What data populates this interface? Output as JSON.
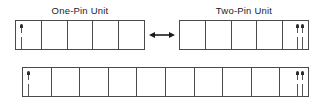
{
  "diagram": {
    "background_color": "#ffffff",
    "line_color": "#4a4a4a",
    "pin_color": "#2b2b2b",
    "units": [
      {
        "id": "one-pin-unit",
        "title": "One-Pin Unit",
        "cell_count": 5,
        "pin_count": 1,
        "pin_position": "left"
      },
      {
        "id": "two-pin-unit",
        "title": "Two-Pin Unit",
        "cell_count": 5,
        "pin_count": 2,
        "pin_position": "right"
      }
    ],
    "connector": {
      "name": "double-headed-arrow",
      "symbol": "↔",
      "direction": "bidirectional"
    },
    "combined": {
      "id": "combined-unit",
      "title": "",
      "cell_count": 10,
      "left_pin_count": 1,
      "right_pin_count": 2
    }
  }
}
